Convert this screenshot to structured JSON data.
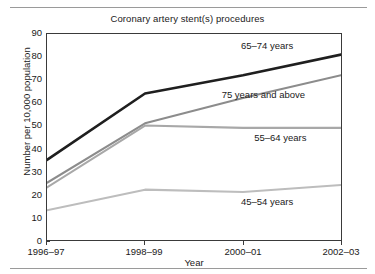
{
  "chart_data": {
    "type": "line",
    "title": "Coronary artery stent(s) procedures",
    "xlabel": "Year",
    "ylabel": "Number per 10,000 population",
    "categories": [
      "1996–97",
      "1998–99",
      "2000–01",
      "2002–03"
    ],
    "ylim": [
      0,
      90
    ],
    "yticks": [
      0,
      10,
      20,
      30,
      40,
      50,
      60,
      70,
      80,
      90
    ],
    "grid": false,
    "legend_position": "in-plot labels",
    "series": [
      {
        "name": "65–74 years",
        "values": [
          35,
          64,
          72,
          81
        ],
        "color": "#1f1f1f",
        "label_text": "65–74 years"
      },
      {
        "name": "75 years and above",
        "values": [
          25,
          51,
          62,
          72
        ],
        "color": "#8c8c8c",
        "label_text": "75 years and above"
      },
      {
        "name": "55–64 years",
        "values": [
          23,
          50,
          49,
          49
        ],
        "color": "#a8a8a8",
        "label_text": "55–64 years"
      },
      {
        "name": "45–54 years",
        "values": [
          13,
          22,
          21,
          24
        ],
        "color": "#bdbdbd",
        "label_text": "45–54 years"
      }
    ],
    "annotations": [
      {
        "text": "65–74 years",
        "x_frac": 0.655,
        "y_value": 85.0
      },
      {
        "text": "75 years and above",
        "x_frac": 0.59,
        "y_value": 63.5
      },
      {
        "text": "55–64 years",
        "x_frac": 0.7,
        "y_value": 45.0
      },
      {
        "text": "45–54 years",
        "x_frac": 0.655,
        "y_value": 17.5
      }
    ],
    "axis_color": "#3a3a3a",
    "background": "#ffffff"
  },
  "yticks_text": {
    "t0": "0",
    "t10": "10",
    "t20": "20",
    "t30": "30",
    "t40": "40",
    "t50": "50",
    "t60": "60",
    "t70": "70",
    "t80": "80",
    "t90": "90"
  }
}
